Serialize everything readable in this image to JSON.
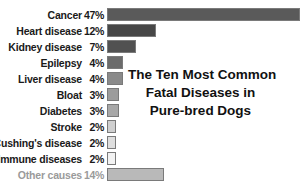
{
  "chart_data": {
    "type": "bar",
    "orientation": "horizontal",
    "title": "The Ten Most Common Fatal Diseases in Pure-bred Dogs",
    "title_lines": [
      "The Ten Most Common",
      "Fatal Diseases in",
      "Pure-bred Dogs"
    ],
    "xlabel": "",
    "ylabel": "",
    "grid": false,
    "legend": null,
    "categories": [
      "Cancer",
      "Heart disease",
      "Kidney disease",
      "Epilepsy",
      "Liver disease",
      "Bloat",
      "Diabetes",
      "Stroke",
      "Cushing's disease",
      "Immune diseases",
      "Other causes"
    ],
    "values": [
      47,
      12,
      7,
      4,
      4,
      3,
      3,
      2,
      2,
      2,
      14
    ],
    "value_labels": [
      "47%",
      "12%",
      "7%",
      "4%",
      "4%",
      "3%",
      "3%",
      "2%",
      "2%",
      "2%",
      "14%"
    ],
    "unit": "%",
    "colors": [
      "#5a5a5a",
      "#474747",
      "#515151",
      "#6b6b6b",
      "#8a8a8a",
      "#9c9c9c",
      "#a8a8a8",
      "#cfcfcf",
      "#dedede",
      "#f2f2f2",
      "#b9b9b9"
    ]
  }
}
